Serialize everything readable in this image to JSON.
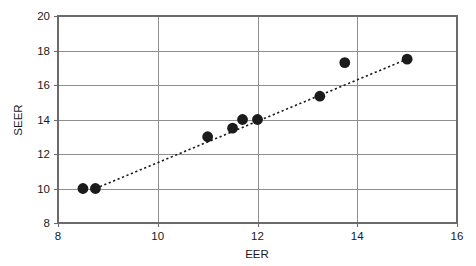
{
  "chart_data": {
    "type": "scatter",
    "title": "",
    "xlabel": "EER",
    "ylabel": "SEER",
    "xlim": [
      8,
      16
    ],
    "ylim": [
      8,
      20
    ],
    "xticks": [
      8,
      10,
      12,
      14,
      16
    ],
    "yticks": [
      8,
      10,
      12,
      14,
      16,
      18,
      20
    ],
    "xtick_labels": [
      "8",
      "10",
      "12",
      "14",
      "16"
    ],
    "ytick_labels": [
      "8",
      "10",
      "12",
      "14",
      "16",
      "18",
      "20"
    ],
    "grid": true,
    "grid_axis": "y",
    "legend": null,
    "series": [
      {
        "name": "EER vs SEER",
        "marker": "filled-circle",
        "color": "#1b1b1b",
        "points": [
          {
            "x": 8.5,
            "y": 10.0
          },
          {
            "x": 8.75,
            "y": 10.0
          },
          {
            "x": 11.0,
            "y": 13.0
          },
          {
            "x": 11.5,
            "y": 13.5
          },
          {
            "x": 11.7,
            "y": 14.0
          },
          {
            "x": 12.0,
            "y": 14.0
          },
          {
            "x": 13.25,
            "y": 15.35
          },
          {
            "x": 13.75,
            "y": 17.3
          },
          {
            "x": 15.0,
            "y": 17.5
          }
        ]
      }
    ],
    "trendline": {
      "name": "fit-line",
      "style": "dotted",
      "color": "#1b1b1b",
      "x_start": 8.75,
      "y_start": 10.0,
      "x_end": 15.0,
      "y_end": 17.5
    }
  },
  "axes": {
    "x_title": "EER",
    "y_title": "SEER"
  }
}
